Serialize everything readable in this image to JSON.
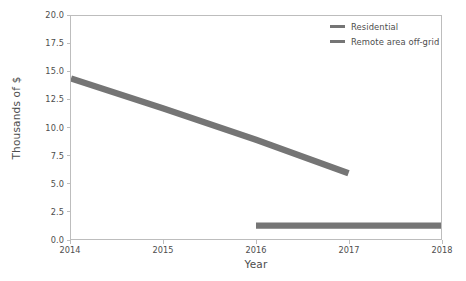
{
  "chart_data": {
    "type": "line",
    "title": "",
    "xlabel": "Year",
    "ylabel": "Thousands of $",
    "xlim": [
      2014,
      2018
    ],
    "ylim": [
      0.0,
      20.0
    ],
    "xticks": [
      "2014",
      "2015",
      "2016",
      "2017",
      "2018"
    ],
    "yticks": [
      "0.0",
      "2.5",
      "5.0",
      "7.5",
      "10.0",
      "12.5",
      "15.0",
      "17.5",
      "20.0"
    ],
    "grid": false,
    "legend_position": "upper right",
    "series": [
      {
        "name": "Residential",
        "color": "#757575",
        "x": [
          2014,
          2015,
          2016,
          2017
        ],
        "values": [
          14.4,
          11.7,
          8.9,
          5.9
        ]
      },
      {
        "name": "Remote area off-grid",
        "color": "#757575",
        "x": [
          2016,
          2017,
          2018
        ],
        "values": [
          1.2,
          1.2,
          1.2
        ]
      }
    ]
  },
  "legend": {
    "items": [
      {
        "label": "Residential",
        "color": "#757575"
      },
      {
        "label": "Remote area off-grid",
        "color": "#757575"
      }
    ]
  },
  "axes": {
    "x_title": "Year",
    "y_title": "Thousands of $",
    "spine_color": "#bdbdbd",
    "tick_color": "#4d4d4d"
  }
}
